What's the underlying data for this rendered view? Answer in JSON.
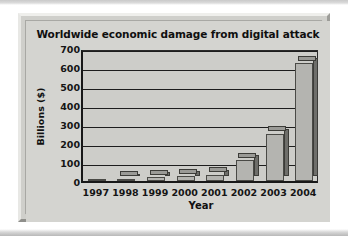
{
  "chart_data": {
    "type": "bar",
    "title": "Worldwide economic damage from digital attack",
    "xlabel": "Year",
    "ylabel": "Billions ($)",
    "categories": [
      "1997",
      "1998",
      "1999",
      "2000",
      "2001",
      "2002",
      "2003",
      "2004"
    ],
    "values": [
      3,
      12,
      20,
      25,
      33,
      110,
      250,
      620
    ],
    "ylim": [
      0,
      700
    ],
    "ytick_labels": [
      "700",
      "600",
      "500",
      "400",
      "300",
      "200",
      "100",
      "0"
    ],
    "ytick_values": [
      700,
      600,
      500,
      400,
      300,
      200,
      100,
      0
    ],
    "grid": true,
    "legend": "none",
    "style": "3d-bars",
    "colors": {
      "bar_front": "#b4b4b0",
      "bar_side": "#6e6e6a",
      "bar_top": "#9a9a96",
      "plot_background": "#cdcdc9",
      "chart_background": "#d4d4d0",
      "axis": "#181818",
      "text": "#111111"
    }
  }
}
